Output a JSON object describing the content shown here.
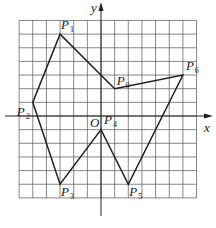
{
  "figure": {
    "axes": {
      "x_label": "x",
      "y_label": "y",
      "origin_label": "O",
      "x_range": [
        -6,
        7
      ],
      "y_range": [
        -6,
        7
      ],
      "grid": true,
      "grid_step": 1
    },
    "points": [
      {
        "name": "P",
        "sub": "0",
        "x": 1,
        "y": 2
      },
      {
        "name": "P",
        "sub": "1",
        "x": -3,
        "y": 6
      },
      {
        "name": "P",
        "sub": "2",
        "x": -5,
        "y": 1
      },
      {
        "name": "P",
        "sub": "3",
        "x": -3,
        "y": -5
      },
      {
        "name": "P",
        "sub": "4",
        "x": 0,
        "y": -1
      },
      {
        "name": "P",
        "sub": "5",
        "x": 2,
        "y": -5
      },
      {
        "name": "P",
        "sub": "6",
        "x": 6,
        "y": 3
      }
    ],
    "polygon_order": [
      0,
      1,
      2,
      3,
      4,
      5,
      6,
      0
    ],
    "colors": {
      "grid": "#555555",
      "axis": "#222222",
      "polyline": "#222222"
    }
  }
}
